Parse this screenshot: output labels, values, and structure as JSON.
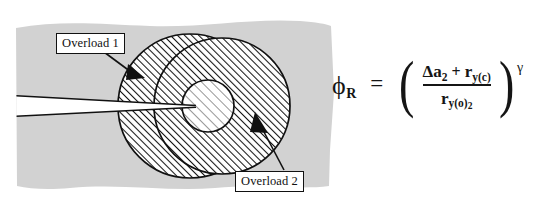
{
  "figure": {
    "kind": "technical-diagram",
    "background_color": "#d2d2d2",
    "outline_color": "#111111",
    "hatch_color": "#111111",
    "inner_zone_fill": "#ffffff"
  },
  "callouts": [
    {
      "id": "overload-1",
      "text": "Overload 1"
    },
    {
      "id": "overload-2",
      "text": "Overload 2"
    }
  ],
  "equation": {
    "lhs_symbol": "ϕ",
    "lhs_subscript": "R",
    "equals": "=",
    "numerator": {
      "delta": "Δ",
      "term1_base": "a",
      "term1_sub": "2",
      "operator": "+",
      "term2_base": "r",
      "term2_sub": "y(c)"
    },
    "denominator": {
      "base": "r",
      "sub": "y(o)",
      "subsub": "2"
    },
    "exponent": "γ",
    "paren_left": "(",
    "paren_right": ")"
  },
  "zones": {
    "outer_label": "Overload 1 plastic zone",
    "middle_label": "Overload 2 plastic zone",
    "inner_label": "current crack tip plastic zone"
  }
}
